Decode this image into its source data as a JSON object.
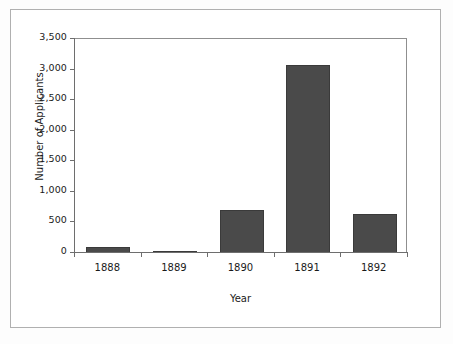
{
  "figure": {
    "background_color": "#ffffff",
    "frame_color": "#b0b0b0"
  },
  "chart_data": {
    "type": "bar",
    "title": "",
    "categories": [
      "1888",
      "1889",
      "1890",
      "1891",
      "1892"
    ],
    "values": [
      90,
      40,
      700,
      3075,
      640
    ],
    "series": [
      {
        "name": "Number of Applicants",
        "values": [
          90,
          40,
          700,
          3075,
          640
        ]
      }
    ],
    "xlabel": "Year",
    "ylabel": "Number of Applicants",
    "ylim": [
      0,
      3500
    ],
    "xlim": [
      0,
      5
    ],
    "y_ticks": [
      0,
      500,
      1000,
      1500,
      2000,
      2500,
      3000,
      3500
    ],
    "y_tick_labels": [
      "0",
      "500",
      "1,000",
      "1,500",
      "2,000",
      "2,500",
      "3,000",
      "3,500"
    ],
    "x_tick_labels": [
      "1888",
      "1889",
      "1890",
      "1891",
      "1892"
    ],
    "grid": false,
    "legend": null,
    "legend_position": "none",
    "bar_color": "#4a4a4a",
    "bar_edge_color": "#3a3a3a",
    "axis_color": "#6e6e6e",
    "plot_frame_color": "#8f8f8f"
  }
}
